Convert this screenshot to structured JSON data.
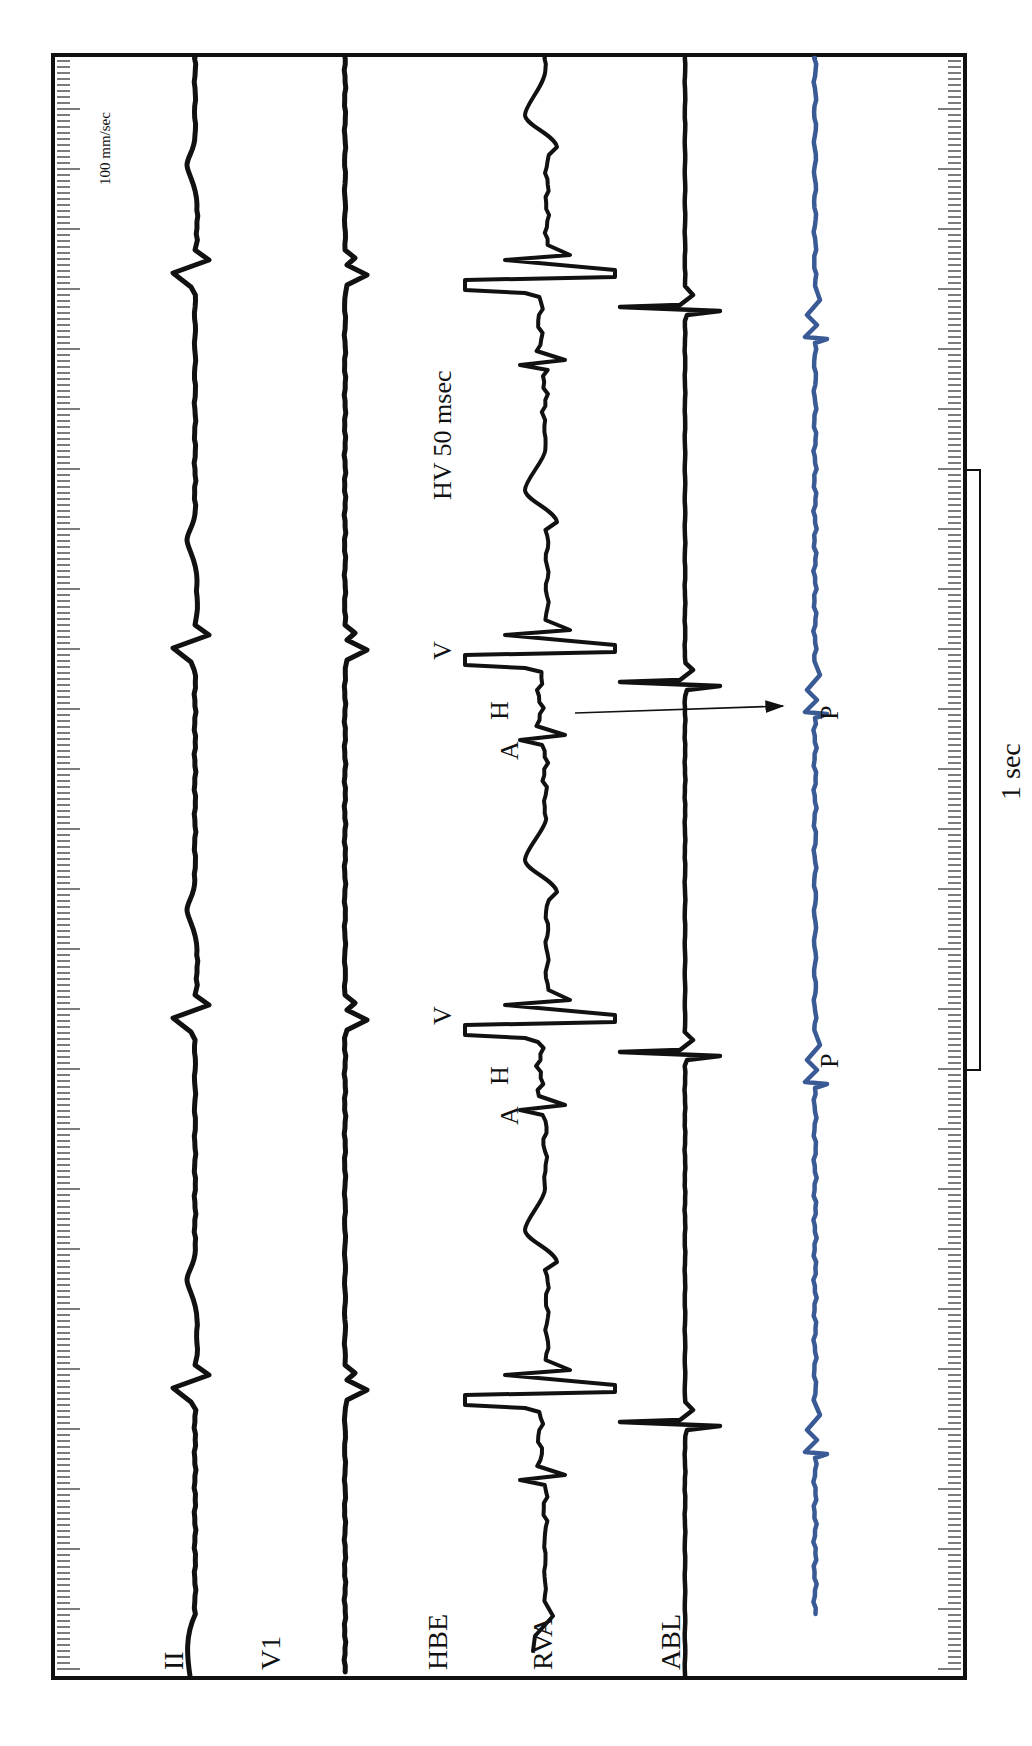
{
  "chart_data": {
    "type": "line",
    "title": "",
    "paper_speed_label": "100 mm/sec",
    "scale_bar_label": "1 sec",
    "annotation_hv": "HV 50 msec",
    "orientation": "vertical-time-axis",
    "time_axis": {
      "minor_tick_px": 6,
      "major_tick_every": 10,
      "grid": false
    },
    "channels": [
      {
        "name": "II",
        "color": "#111111",
        "x": 195
      },
      {
        "name": "V1",
        "color": "#111111",
        "x": 345
      },
      {
        "name": "HBE",
        "color": "#111111",
        "x": 545
      },
      {
        "name": "RVA",
        "color": "#111111",
        "x": 685
      },
      {
        "name": "ABL",
        "color": "#3a5a96",
        "x": 815
      }
    ],
    "beats_y": [
      265,
      640,
      1010,
      1380
    ],
    "annotations": [
      {
        "text": "V",
        "beat": 1
      },
      {
        "text": "V",
        "beat": 2
      },
      {
        "text": "A",
        "beat": 1
      },
      {
        "text": "H",
        "beat": 1
      },
      {
        "text": "A",
        "beat": 2
      },
      {
        "text": "H",
        "beat": 2
      },
      {
        "text": "P",
        "beat": 1
      },
      {
        "text": "P",
        "beat": 2
      }
    ],
    "legend": []
  },
  "labels": {
    "speed": "100 mm/sec",
    "hv": "HV 50 msec",
    "one_sec": "1 sec",
    "ch_II": "II",
    "ch_V1": "V1",
    "ch_HBE": "HBE",
    "ch_RVA": "RVA",
    "ch_ABL": "ABL",
    "V1_mark": "V",
    "V2_mark": "V",
    "A1": "A",
    "H1": "H",
    "A2": "A",
    "H2": "H",
    "P1": "P",
    "P2": "P"
  }
}
